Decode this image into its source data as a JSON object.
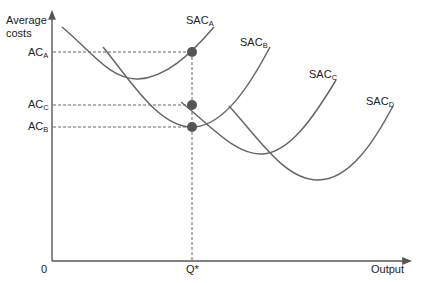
{
  "diagram": {
    "y_axis_label_line1": "Average",
    "y_axis_label_line2": "costs",
    "x_axis_label": "Output",
    "origin_label": "0",
    "q_star_label": "Q*",
    "y_levels": [
      {
        "main": "AC",
        "sub": "A"
      },
      {
        "main": "AC",
        "sub": "C"
      },
      {
        "main": "AC",
        "sub": "B"
      }
    ],
    "curves": [
      {
        "main": "SAC",
        "sub": "A"
      },
      {
        "main": "SAC",
        "sub": "B"
      },
      {
        "main": "SAC",
        "sub": "C"
      },
      {
        "main": "SAC",
        "sub": "D"
      }
    ],
    "colors": {
      "curve": "#666666",
      "axis": "#555555",
      "dot": "#555555",
      "text": "#222222"
    }
  }
}
